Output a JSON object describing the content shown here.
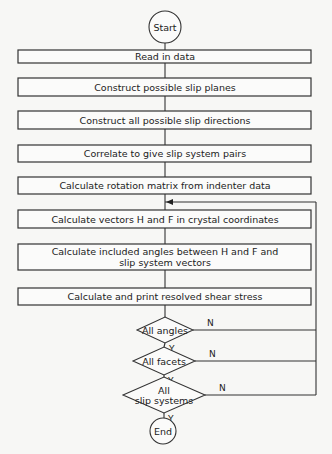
{
  "flowchart": {
    "start": "Start",
    "end": "End",
    "steps": [
      "Read in data",
      "Construct possible slip planes",
      "Construct all possible slip directions",
      "Correlate to give slip system pairs",
      "Calculate rotation matrix from indenter data",
      "Calculate vectors  H and F in crystal coordinates",
      [
        "Calculate included angles between  H and F and",
        "slip system vectors"
      ],
      "Calculate and print  resolved shear stress"
    ],
    "decisions": [
      {
        "label": [
          "All angles"
        ],
        "yes": "Y",
        "no": "N"
      },
      {
        "label": [
          "All facets"
        ],
        "yes": "Y",
        "no": "N"
      },
      {
        "label": [
          "All",
          "slip systems"
        ],
        "yes": "Y",
        "no": "N"
      }
    ]
  }
}
